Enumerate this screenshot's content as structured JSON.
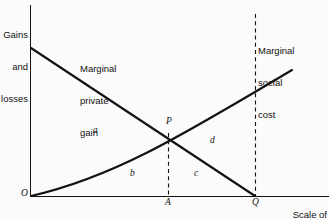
{
  "figure": {
    "type": "economics-diagram",
    "background_color": "#fbfbfb",
    "line_color": "#121212",
    "text_color": "#121212",
    "axes": {
      "y_caption": "Gains\nand\nlosses",
      "y_caption_lines": [
        "Gains",
        "and",
        "losses"
      ],
      "x_caption": "Scale of\nactivity",
      "x_caption_lines": [
        "Scale of",
        "activity"
      ],
      "origin_label": "O",
      "x_tick_labels": [
        "A",
        "Q"
      ]
    },
    "curves": [
      {
        "id": "marginal-private-gain",
        "label": "Marginal\nprivate\ngain",
        "label_lines": [
          "Marginal",
          "private",
          "gain"
        ],
        "shape": "straight-downward-sloping",
        "start": [
          31,
          48
        ],
        "end": [
          255,
          196
        ]
      },
      {
        "id": "marginal-social-cost",
        "label": "Marginal\nsocial\ncost",
        "label_lines": [
          "Marginal",
          "social",
          "cost"
        ],
        "shape": "convex-upward-sloping",
        "start": [
          31,
          196
        ],
        "end": [
          292,
          70
        ]
      }
    ],
    "points": [
      {
        "id": "intersection",
        "label": "P",
        "x": 168,
        "y": 129
      },
      {
        "id": "origin",
        "label": "O",
        "x": 30,
        "y": 196
      },
      {
        "id": "efficient-output",
        "label": "A",
        "x": 168,
        "y": 196
      },
      {
        "id": "private-output",
        "label": "Q",
        "x": 255,
        "y": 196
      }
    ],
    "areas": [
      {
        "id": "area-a",
        "label": "a"
      },
      {
        "id": "area-b",
        "label": "b"
      },
      {
        "id": "area-c",
        "label": "c"
      },
      {
        "id": "area-d",
        "label": "d"
      }
    ],
    "dashed_lines": [
      {
        "id": "dashed-at-A",
        "x": 168,
        "from_y": 133,
        "to_y": 196
      },
      {
        "id": "dashed-at-Q",
        "x": 255,
        "from_y": 14,
        "to_y": 196
      }
    ]
  }
}
